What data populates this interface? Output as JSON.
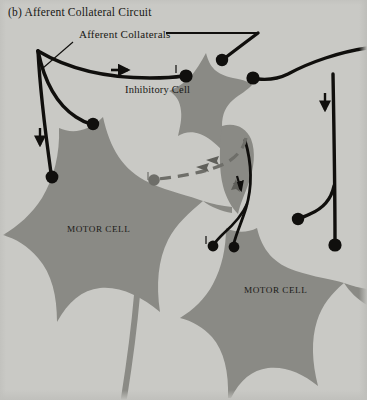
{
  "figure": {
    "title": "(b) Afferent Collateral Circuit",
    "panel_letter": "(b)",
    "width": 367,
    "height": 400
  },
  "labels": {
    "afferent_collaterals": "Afferent Collaterals",
    "inhibitory_cell": "Inhibitory Cell",
    "motor_cell_left": "MOTOR CELL",
    "motor_cell_right": "MOTOR CELL"
  },
  "colors": {
    "background": "#c9c9c5",
    "cell_body": "#8a8a85",
    "cell_body_dark": "#7e7e79",
    "neuron_line": "#100f0d",
    "dashed_line": "#6e6e69",
    "text": "#171714"
  },
  "cells": [
    {
      "name": "inhibitory-cell",
      "label": "Inhibitory Cell",
      "type": "interneuron",
      "center_x": 215,
      "center_y": 95
    },
    {
      "name": "motor-cell-left",
      "label": "MOTOR CELL",
      "type": "motor-neuron",
      "center_x": 110,
      "center_y": 240
    },
    {
      "name": "motor-cell-right",
      "label": "MOTOR CELL",
      "type": "motor-neuron",
      "center_x": 275,
      "center_y": 300
    }
  ],
  "pathways": [
    {
      "name": "afferent-fiber-left",
      "style": "solid",
      "direction_arrow": "down",
      "terminals": 2
    },
    {
      "name": "afferent-collateral-to-inhibitory",
      "style": "solid",
      "direction_arrow": "right",
      "terminals": 1
    },
    {
      "name": "afferent-fiber-right",
      "style": "solid",
      "direction_arrow": "down",
      "terminals": 2
    },
    {
      "name": "recurrent-inhibition",
      "style": "dashed",
      "direction_arrow": "left",
      "terminals": 1
    },
    {
      "name": "inhibitory-axon",
      "style": "solid",
      "direction_arrow": "down",
      "terminals": 2
    }
  ]
}
